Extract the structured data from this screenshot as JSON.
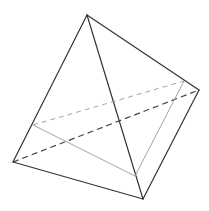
{
  "figure": {
    "type": "tetrahedron-with-cross-section",
    "vertices": {
      "top": [
        87,
        15
      ],
      "left": [
        13,
        162
      ],
      "bottom": [
        143,
        199
      ],
      "right": [
        199,
        90
      ]
    },
    "section_points": {
      "on_top_left": [
        33,
        125
      ],
      "on_top_bottom": [
        135,
        176
      ],
      "on_top_right": [
        184,
        81
      ]
    },
    "colors": {
      "edge": "#333333",
      "section": "#9a9a9a",
      "background": "#ffffff"
    }
  }
}
